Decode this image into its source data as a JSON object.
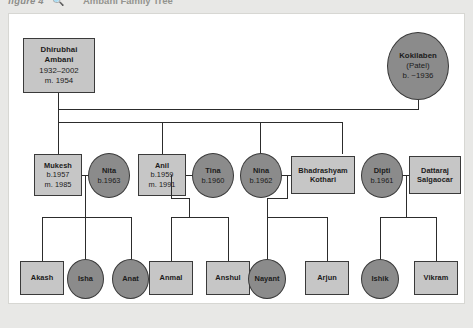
{
  "caption": {
    "label": "figure",
    "number": "4",
    "icon": "magnifier-icon",
    "title": "Ambani Family Tree"
  },
  "colors": {
    "male_fill": "#c6c6c6",
    "female_fill": "#8b8b8b",
    "stroke": "#3a3a3a",
    "panel_bg": "#ffffff",
    "page_bg": "#e8e8e6"
  },
  "diagram": {
    "type": "family-tree",
    "shape_legend": {
      "rectangle": "male",
      "ellipse": "female"
    },
    "generations": [
      {
        "id": "gen1",
        "label": "Founders",
        "people": [
          {
            "id": "dhirubhai",
            "name": "Dhirubhai Ambani",
            "name_line1": "Dhirubhai",
            "name_line2": "Ambani",
            "sex": "male",
            "shape": "rectangle",
            "dates": "1932–2002",
            "married": "m. 1954"
          },
          {
            "id": "kokilaben",
            "name": "Kokilaben",
            "name_line1": "Kokilaben",
            "maiden": "(Patel)",
            "sex": "female",
            "shape": "ellipse",
            "dates": "b. ~1936",
            "married": ""
          }
        ]
      },
      {
        "id": "gen2",
        "label": "Children and spouses",
        "people": [
          {
            "id": "mukesh",
            "name": "Mukesh",
            "sex": "male",
            "shape": "rectangle",
            "dates": "b.1957",
            "married": "m. 1985"
          },
          {
            "id": "nita",
            "name": "Nita",
            "sex": "female",
            "shape": "ellipse",
            "dates": "b.1963",
            "married": ""
          },
          {
            "id": "anil",
            "name": "Anil",
            "sex": "male",
            "shape": "rectangle",
            "dates": "b.1959",
            "married": "m. 1991"
          },
          {
            "id": "tina",
            "name": "Tina",
            "sex": "female",
            "shape": "ellipse",
            "dates": "b.1960",
            "married": ""
          },
          {
            "id": "nina",
            "name": "Nina",
            "sex": "female",
            "shape": "ellipse",
            "dates": "b.1962",
            "married": ""
          },
          {
            "id": "bhadrashyam",
            "name": "Bhadrashyam Kothari",
            "name_line1": "Bhadrashyam",
            "name_line2": "Kothari",
            "sex": "male",
            "shape": "rectangle",
            "dates": "",
            "married": ""
          },
          {
            "id": "dipti",
            "name": "Dipti",
            "sex": "female",
            "shape": "ellipse",
            "dates": "b.1961",
            "married": ""
          },
          {
            "id": "dattaraj",
            "name": "Dattaraj Salgaocar",
            "name_line1": "Dattaraj",
            "name_line2": "Salgaocar",
            "sex": "male",
            "shape": "rectangle",
            "dates": "",
            "married": ""
          }
        ]
      },
      {
        "id": "gen3",
        "label": "Grandchildren",
        "people": [
          {
            "id": "akash",
            "name": "Akash",
            "sex": "male",
            "shape": "rectangle",
            "parents": "mukesh-nita"
          },
          {
            "id": "isha",
            "name": "Isha",
            "sex": "female",
            "shape": "ellipse",
            "parents": "mukesh-nita"
          },
          {
            "id": "anat",
            "name": "Anat",
            "sex": "female",
            "shape": "ellipse",
            "parents": "mukesh-nita"
          },
          {
            "id": "anmal",
            "name": "Anmal",
            "sex": "male",
            "shape": "rectangle",
            "parents": "anil-tina"
          },
          {
            "id": "anshul",
            "name": "Anshul",
            "sex": "male",
            "shape": "rectangle",
            "parents": "anil-tina"
          },
          {
            "id": "nayant",
            "name": "Nayant",
            "sex": "female",
            "shape": "ellipse",
            "parents": "nina-bhadrashyam"
          },
          {
            "id": "arjun",
            "name": "Arjun",
            "sex": "male",
            "shape": "rectangle",
            "parents": "nina-bhadrashyam"
          },
          {
            "id": "ishik",
            "name": "Ishik",
            "sex": "female",
            "shape": "ellipse",
            "parents": "dipti-dattaraj"
          },
          {
            "id": "vikram",
            "name": "Vikram",
            "sex": "male",
            "shape": "rectangle",
            "parents": "dipti-dattaraj"
          }
        ]
      }
    ]
  }
}
